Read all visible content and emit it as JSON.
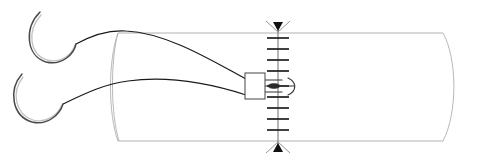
{
  "figure": {
    "background_color": "#ffffff",
    "width": 478,
    "height": 162
  },
  "colors": {
    "tube_outline": "#a8a8a8",
    "tube_end": "#b0b0b0",
    "thread": "#1a1a1a",
    "needle": "#4a4a4a",
    "needle_highlight": "#c2c2c2",
    "seam_axis": "#6e6e6e",
    "seam_tick": "#1e1e1e",
    "arrow": "#111111",
    "clip_stroke": "#555555",
    "clip_fill": "#ffffff",
    "bead": "#2a2a2a",
    "hook": "#3a3a3a"
  },
  "tube": {
    "name": "tubular-vessel-body",
    "top_edge_path": "M 118 33 L 443 33",
    "bottom_edge_path": "M 118 141 L 443 141",
    "left_open_end_path": "M 118 33 C 108 60, 108 114, 118 141",
    "right_cap_path": "M 443 33 C 457 58, 458 112, 443 141",
    "left_lip_path": "M 118 33 C 110 62, 111 116, 119 141"
  },
  "seam": {
    "name": "suture-seam-line",
    "axis_x": 278,
    "axis_top_y": 22,
    "axis_bottom_y": 152,
    "tick_half_width": 11,
    "tick_count": 11,
    "tick_ys": [
      38,
      49,
      60,
      71,
      86,
      97,
      108,
      119,
      130
    ],
    "arrow_top": {
      "x": 278,
      "y": 31,
      "direction": "down"
    },
    "arrow_bottom": {
      "x": 278,
      "y": 143,
      "direction": "up"
    },
    "arrow_wing_top_path": "M 266 21 L 278 32 L 290 21",
    "arrow_wing_bottom_path": "M 266 153 L 278 142 L 290 153"
  },
  "needles": [
    {
      "name": "curved-needle-upper",
      "arc_path": "M 40 12 C 24 28, 26 56, 46 62 C 62 66, 74 54, 76 44",
      "highlight_path": "M 41 15 C 27 30, 29 54, 47 60 C 62 64, 72 54, 75 45"
    },
    {
      "name": "curved-needle-lower",
      "arc_path": "M 22 74 C 8 90, 12 116, 32 122 C 48 126, 60 114, 63 104",
      "highlight_path": "M 23 77 C 11 92, 15 114, 33 120 C 47 124, 58 114, 62 105"
    }
  ],
  "threads": [
    {
      "name": "suture-thread-upper",
      "path": "M 76 44 C 96 33, 112 30, 126 31 C 168 33, 214 62, 246 79"
    },
    {
      "name": "suture-thread-lower",
      "path": "M 63 104 C 84 94, 104 84, 128 81 C 172 75, 218 86, 246 95"
    }
  ],
  "clip": {
    "name": "suture-anchor-clip",
    "x": 245,
    "y": 73,
    "width": 20,
    "height": 26,
    "lead_upper_path": "M 265 80 L 282 80",
    "lead_lower_path": "M 265 92 L 282 92",
    "lead_mid_path": "M 265 86 L 294 86",
    "bead": {
      "cx": 274,
      "cy": 86,
      "rx": 6,
      "ry": 2.6
    },
    "hook_arc_path": "M 288 78 C 297 82, 297 91, 288 95"
  },
  "labels": {
    "figure_caption": "",
    "annotations": []
  }
}
